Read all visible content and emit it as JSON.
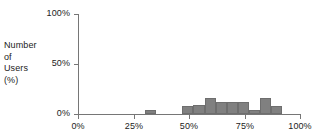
{
  "chart_data": {
    "type": "bar",
    "title": "",
    "subtitle": "",
    "xlabel": "",
    "ylabel": "Number of Users (%)",
    "ylabel_lines": [
      "Number",
      "of",
      "Users",
      "(%)"
    ],
    "xlim": [
      0,
      100
    ],
    "ylim": [
      0,
      100
    ],
    "grid": false,
    "legend": null,
    "bar_color": "#808080",
    "axis_color": "#767676",
    "text_color": "#222222",
    "xticks": [
      "0%",
      "25%",
      "50%",
      "75%",
      "100%"
    ],
    "xtick_values": [
      0,
      25,
      50,
      75,
      100
    ],
    "yticks": [
      "0%",
      "50%",
      "100%"
    ],
    "ytick_values": [
      0,
      50,
      100
    ],
    "bin_width": 5,
    "categories": [
      "30-35%",
      "47-52%",
      "52-57%",
      "57-62%",
      "62-67%",
      "67-72%",
      "72-77%",
      "77-82%",
      "82-87%",
      "87-92%"
    ],
    "bin_starts": [
      30,
      47,
      52,
      57,
      62,
      67,
      72,
      77,
      82,
      87
    ],
    "values": [
      4,
      8,
      9,
      16,
      12,
      12,
      12,
      4,
      16,
      8
    ]
  }
}
